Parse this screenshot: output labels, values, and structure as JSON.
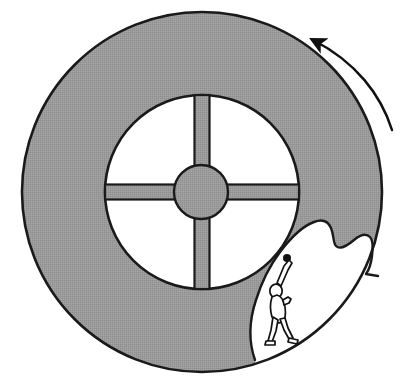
{
  "figure": {
    "caption": "",
    "canvas": {
      "width": 416,
      "height": 387,
      "background": "#ffffff"
    }
  },
  "palette": {
    "shaded_gray": "#9a9a9a",
    "outline_black": "#1a1a1a",
    "white": "#ffffff",
    "figure_outline": "#111111"
  },
  "parts": [
    {
      "id": "outer-ring",
      "label": "Outer ring",
      "shape": "annulus",
      "center": [
        202,
        192
      ],
      "outer_radius": 180,
      "inner_radius": 97,
      "fill": "#9a9a9a",
      "stroke": "#1a1a1a",
      "stroke_width": 2.4
    },
    {
      "id": "hub",
      "label": "Central hub",
      "shape": "circle",
      "center": [
        201,
        192
      ],
      "radius": 27,
      "fill": "#9a9a9a",
      "stroke": "#1a1a1a",
      "stroke_width": 2.4
    },
    {
      "id": "spokes",
      "label": "Spokes",
      "shape": "cross",
      "count": 4,
      "width": 15,
      "fill": "#9a9a9a",
      "stroke": "#1a1a1a",
      "stroke_width": 2.2,
      "angles_deg": [
        0,
        90,
        180,
        270
      ]
    },
    {
      "id": "cavity",
      "label": "Excavated cavity",
      "shape": "irregular-region",
      "fill": "#ffffff",
      "stroke": "#1a1a1a",
      "stroke_width": 2.2,
      "location": "lower-right of ring"
    },
    {
      "id": "pebble",
      "label": "Small object",
      "shape": "dot",
      "center": [
        287,
        258
      ],
      "radius": 4,
      "fill": "#111111"
    },
    {
      "id": "human-figure",
      "label": "Human figure for scale",
      "shape": "stick-figure",
      "position": [
        276,
        300
      ],
      "height_px": 58,
      "pose": "one arm raised overhead",
      "fill": "#ffffff",
      "stroke": "#111111",
      "stroke_width": 1.6
    },
    {
      "id": "rotation-arrow",
      "label": "Rotation direction arrow",
      "shape": "curved-arrow",
      "direction": "counterclockwise",
      "stroke": "#111111",
      "stroke_width": 2.4,
      "arrowhead": "solid-triangle",
      "start": [
        392,
        130
      ],
      "end": [
        313,
        38
      ]
    }
  ],
  "annotations": {
    "rotation_arrow_title": "direction of rotation",
    "human_figure_title": "person (scale reference)",
    "pebble_title": "loose object",
    "cavity_title": "excavated cavity"
  }
}
